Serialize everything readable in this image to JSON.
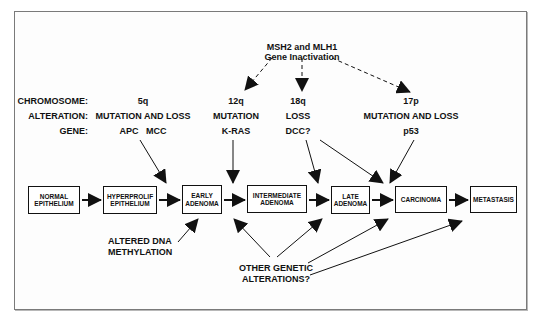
{
  "diagram": {
    "top_factor": {
      "line1": "MSH2 and MLH1",
      "line2": "Gene Inactivation"
    },
    "row_labels": {
      "chromosome": "CHROMOSOME:",
      "alteration": "ALTERATION:",
      "gene": "GENE:"
    },
    "columns": [
      {
        "chromosome": "5q",
        "alteration": "MUTATION AND LOSS",
        "gene": "APC   MCC"
      },
      {
        "chromosome": "12q",
        "alteration": "MUTATION",
        "gene": "K-RAS"
      },
      {
        "chromosome": "18q",
        "alteration": "LOSS",
        "gene": "DCC?"
      },
      {
        "chromosome": "17p",
        "alteration": "MUTATION AND LOSS",
        "gene": "p53"
      }
    ],
    "stages": [
      {
        "line1": "NORMAL",
        "line2": "EPITHELIUM"
      },
      {
        "line1": "HYPERPROLIF",
        "line2": "EPITHELIUM"
      },
      {
        "line1": "EARLY",
        "line2": "ADENOMA"
      },
      {
        "line1": "INTERMEDIATE",
        "line2": "ADENOMA"
      },
      {
        "line1": "LATE",
        "line2": "ADENOMA"
      },
      {
        "line1": "CARCINOMA",
        "line2": ""
      },
      {
        "line1": "METASTASIS",
        "line2": ""
      }
    ],
    "bottom_notes": {
      "methylation": {
        "line1": "ALTERED DNA",
        "line2": "METHYLATION"
      },
      "other": {
        "line1": "OTHER GENETIC",
        "line2": "ALTERATIONS?"
      }
    }
  }
}
